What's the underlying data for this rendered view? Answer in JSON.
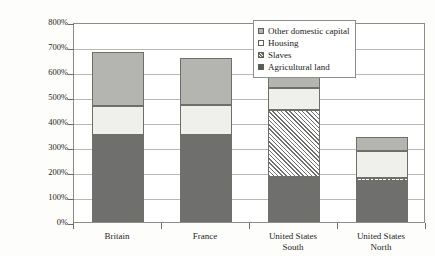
{
  "chart_data": {
    "type": "bar",
    "stacked": true,
    "title": "",
    "subtitle": "",
    "xlabel": "",
    "ylabel": "Value of capital (% national income)",
    "ylim": [
      0,
      800
    ],
    "ytick_labels": [
      "800%",
      "700%",
      "600%",
      "500%",
      "400%",
      "300%",
      "200%",
      "100%",
      "0%"
    ],
    "ytick_values": [
      800,
      700,
      600,
      500,
      400,
      300,
      200,
      100,
      0
    ],
    "ytick_suffix": "%",
    "grid": true,
    "legend_position": "top-right",
    "categories": [
      "Britain",
      "France",
      "United States\nSouth",
      "United States\nNorth"
    ],
    "category_labels": [
      {
        "line1": "Britain",
        "line2": ""
      },
      {
        "line1": "France",
        "line2": ""
      },
      {
        "line1": "United States",
        "line2": "South"
      },
      {
        "line1": "United States",
        "line2": "North"
      }
    ],
    "series": [
      {
        "name": "Agricultural land",
        "pattern": "solid-dark",
        "color": "#6f6f6d",
        "values": [
          348,
          350,
          180,
          165
        ]
      },
      {
        "name": "Slaves",
        "pattern": "diagonal-hatch",
        "color": "#6f6f6d",
        "values": [
          0,
          0,
          270,
          10
        ]
      },
      {
        "name": "Housing",
        "pattern": "solid-light",
        "color": "#efefeb",
        "values": [
          117,
          120,
          85,
          110
        ]
      },
      {
        "name": "Other domestic capital",
        "pattern": "solid-grey",
        "color": "#b4b4b0",
        "values": [
          215,
          185,
          75,
          55
        ]
      }
    ],
    "totals": [
      680,
      655,
      610,
      340
    ],
    "cumulative_tops": [
      {
        "agricultural_land": 348,
        "slaves": 348,
        "housing": 465,
        "other_domestic_capital": 680
      },
      {
        "agricultural_land": 350,
        "slaves": 350,
        "housing": 470,
        "other_domestic_capital": 655
      },
      {
        "agricultural_land": 180,
        "slaves": 450,
        "housing": 535,
        "other_domestic_capital": 610
      },
      {
        "agricultural_land": 165,
        "slaves": 175,
        "housing": 285,
        "other_domestic_capital": 340
      }
    ]
  },
  "legend": {
    "items": [
      {
        "label": "Other domestic capital",
        "swatch": "swatch-other-domestic-capital"
      },
      {
        "label": "Housing",
        "swatch": "swatch-housing"
      },
      {
        "label": "Slaves",
        "swatch": "swatch-slaves"
      },
      {
        "label": "Agricultural land",
        "swatch": "swatch-agricultural-land"
      }
    ]
  },
  "colors": {
    "agricultural_land": "#6f6f6d",
    "housing": "#efefeb",
    "other_domestic_capital": "#b4b4b0",
    "slaves_hatch": "#6f6f6d",
    "axis": "#8d8d88",
    "grid": "#b9b9b4",
    "background": "#fdfdfb"
  }
}
